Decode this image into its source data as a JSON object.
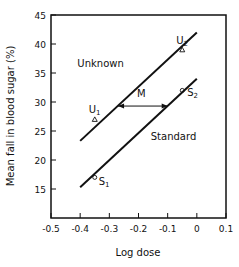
{
  "chart_data": {
    "type": "line",
    "title": "",
    "xlabel": "Log dose",
    "ylabel": "Mean fall in blood sugar (%)",
    "xlim": [
      -0.5,
      0.1
    ],
    "ylim": [
      10,
      45
    ],
    "xticks": [
      -0.5,
      -0.4,
      -0.3,
      -0.2,
      -0.1,
      0,
      0.1
    ],
    "xtick_labels": [
      "-0.5",
      "-0.4",
      "-0.3",
      "-0.2",
      "-0.1",
      "0",
      "0.1"
    ],
    "yticks": [
      15,
      20,
      25,
      30,
      35,
      40,
      45
    ],
    "ytick_labels": [
      "15",
      "20",
      "25",
      "30",
      "35",
      "40",
      "45"
    ],
    "grid": false,
    "series": [
      {
        "name": "Unknown",
        "line": [
          [
            -0.4,
            23.3
          ],
          [
            0.0,
            42.0
          ]
        ],
        "points": [
          {
            "label": "U1",
            "x": -0.35,
            "y": 27
          },
          {
            "label": "U2",
            "x": -0.05,
            "y": 39
          }
        ],
        "marker": "triangle"
      },
      {
        "name": "Standard",
        "line": [
          [
            -0.4,
            15.3
          ],
          [
            0.0,
            34.0
          ]
        ],
        "points": [
          {
            "label": "S1",
            "x": -0.35,
            "y": 17
          },
          {
            "label": "S2",
            "x": -0.05,
            "y": 32
          }
        ],
        "marker": "circle"
      }
    ],
    "annotations": [
      {
        "text": "Unknown",
        "x": -0.33,
        "y": 36
      },
      {
        "text": "Standard",
        "x": -0.08,
        "y": 23.5
      },
      {
        "text": "M",
        "x": -0.19,
        "y": 30.8,
        "arrow_from": [
          -0.27,
          29.3
        ],
        "arrow_to": [
          -0.1,
          29.3
        ]
      }
    ]
  }
}
